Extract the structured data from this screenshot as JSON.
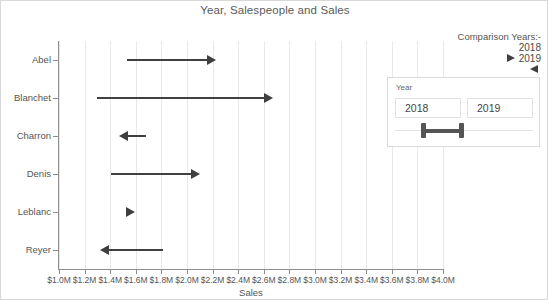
{
  "chart_data": {
    "type": "bar",
    "title": "Year, Salespeople and Sales",
    "xlabel": "Sales",
    "ylabel": "",
    "categories": [
      "Abel",
      "Blanchet",
      "Charron",
      "Denis",
      "Leblanc",
      "Reyer"
    ],
    "xlim": [
      1.0,
      4.0
    ],
    "xtick_labels": [
      "$1.0M",
      "$1.2M",
      "$1.4M",
      "$1.6M",
      "$1.8M",
      "$2.0M",
      "$2.2M",
      "$2.4M",
      "$2.6M",
      "$2.8M",
      "$3.0M",
      "$3.2M",
      "$3.4M",
      "$3.6M",
      "$3.8M",
      "$4.0M"
    ],
    "xtick_values": [
      1.0,
      1.2,
      1.4,
      1.6,
      1.8,
      2.0,
      2.2,
      2.4,
      2.6,
      2.8,
      3.0,
      3.2,
      3.4,
      3.6,
      3.8,
      4.0
    ],
    "grid": true,
    "legend_position": "top-right",
    "series": [
      {
        "name": "2018",
        "values": [
          1.53,
          1.3,
          1.68,
          1.41,
          1.59,
          1.81
        ]
      },
      {
        "name": "2019",
        "values": [
          2.23,
          2.67,
          1.47,
          2.1,
          1.59,
          1.32
        ]
      }
    ],
    "arrows": [
      {
        "category": "Abel",
        "start": 1.53,
        "end": 2.23,
        "direction": "right"
      },
      {
        "category": "Blanchet",
        "start": 1.3,
        "end": 2.67,
        "direction": "right"
      },
      {
        "category": "Charron",
        "start": 1.68,
        "end": 1.47,
        "direction": "left"
      },
      {
        "category": "Denis",
        "start": 1.41,
        "end": 2.1,
        "direction": "right"
      },
      {
        "category": "Leblanc",
        "start": 1.59,
        "end": 1.59,
        "direction": "right"
      },
      {
        "category": "Reyer",
        "start": 1.81,
        "end": 1.32,
        "direction": "left"
      }
    ]
  },
  "legend": {
    "title": "Comparison Years:-",
    "entries": [
      {
        "label": "2018",
        "marker": "none"
      },
      {
        "label": "2019",
        "marker": "arrow-right"
      }
    ],
    "extra_marker": "arrow-left"
  },
  "year_filter": {
    "panel_label": "Year",
    "from_value": "2018",
    "to_value": "2019"
  },
  "colors": {
    "mark": "#3f3f3f",
    "grid": "#e9e9e9",
    "axis": "#8d8d8d",
    "text": "#555555"
  }
}
